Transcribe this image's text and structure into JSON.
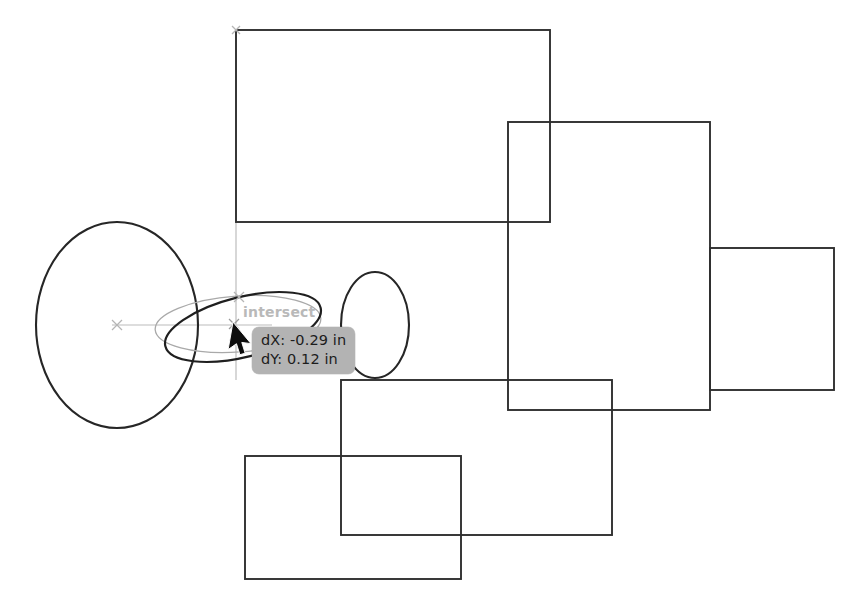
{
  "canvas": {
    "width": 863,
    "height": 610,
    "background_color": "#ffffff",
    "geometry_stroke_color": "#2a2a2a",
    "guide_stroke_color": "#b8b8b8",
    "preview_stroke_color": "#a8a8a8"
  },
  "snap": {
    "label": "intersect",
    "label_color": "#b9b9b9",
    "marker": "x-marker-icon"
  },
  "drag_readout": {
    "line1": "dX: -0.29 in",
    "line2": "dY: 0.12 in",
    "dx_label": "dX:",
    "dx_value": "-0.29",
    "dy_label": "dY:",
    "dy_value": "0.12",
    "units": "in",
    "background_color": "#b3b3b3",
    "text_color": "#1c1c1c"
  },
  "cursor": {
    "type": "arrow-pointer",
    "x": 236,
    "y": 327,
    "color": "#111111"
  },
  "shapes": {
    "rectangles": [
      {
        "name": "rect-top",
        "x": 236,
        "y": 30,
        "width": 314,
        "height": 192
      },
      {
        "name": "rect-center-right",
        "x": 508,
        "y": 122,
        "width": 202,
        "height": 288
      },
      {
        "name": "rect-far-right",
        "x": 710,
        "y": 248,
        "width": 124,
        "height": 142
      },
      {
        "name": "rect-lower-middle",
        "x": 341,
        "y": 380,
        "width": 271,
        "height": 155
      },
      {
        "name": "rect-bottom-left",
        "x": 245,
        "y": 456,
        "width": 216,
        "height": 123
      }
    ],
    "ellipses": [
      {
        "name": "ellipse-large-left",
        "cx": 117,
        "cy": 325,
        "rx": 81,
        "ry": 103
      },
      {
        "name": "ellipse-small-right",
        "cx": 375,
        "cy": 325,
        "rx": 34,
        "ry": 53
      },
      {
        "name": "ellipse-drag-active",
        "cx": 243,
        "cy": 327,
        "rx": 80,
        "ry": 30,
        "rotation_deg": -14
      },
      {
        "name": "ellipse-drag-preview",
        "cx": 238,
        "cy": 324,
        "rx": 83,
        "ry": 28,
        "rotation_deg": -4
      }
    ],
    "guides": [
      {
        "name": "guide-vertical",
        "x1": 236,
        "y1": 30,
        "x2": 236,
        "y2": 380
      },
      {
        "name": "guide-horizontal",
        "x1": 117,
        "y1": 325,
        "x2": 268,
        "y2": 325
      }
    ],
    "markers": [
      {
        "name": "center-marker-large-ellipse",
        "x": 117,
        "y": 325
      },
      {
        "name": "corner-marker-rect-top",
        "x": 236,
        "y": 30
      },
      {
        "name": "snap-marker-intersect",
        "x": 239,
        "y": 297
      },
      {
        "name": "snap-marker-cursor-point",
        "x": 234,
        "y": 324
      }
    ]
  }
}
